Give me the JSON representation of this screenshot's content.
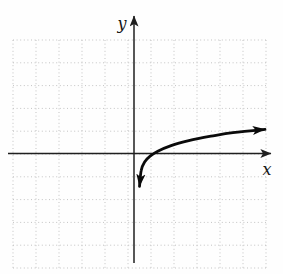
{
  "figure": {
    "background": "#fefefe"
  },
  "chart_data": {
    "type": "line",
    "title": "",
    "xlabel": "x",
    "ylabel": "y",
    "xlim": [
      -5.5,
      6.1
    ],
    "ylim": [
      -5.0,
      5.0
    ],
    "grid": true,
    "grid_style": "dotted",
    "grid_color": "#c3c3c3",
    "axis_color": "#1f1f1f",
    "curve_color": "#0a0a0a",
    "x_intercept": 1,
    "legend": "none",
    "tick_labels": "none",
    "series": [
      {
        "name": "logarithmic-curve",
        "arrow_start": "down",
        "arrow_end": "right",
        "points": [
          [
            0.27,
            -1.45
          ],
          [
            0.35,
            -0.75
          ],
          [
            0.5,
            -0.38
          ],
          [
            0.75,
            -0.12
          ],
          [
            1.1,
            0.1
          ],
          [
            1.7,
            0.35
          ],
          [
            2.5,
            0.57
          ],
          [
            3.5,
            0.76
          ],
          [
            4.5,
            0.92
          ],
          [
            5.95,
            1.06
          ]
        ]
      }
    ]
  }
}
